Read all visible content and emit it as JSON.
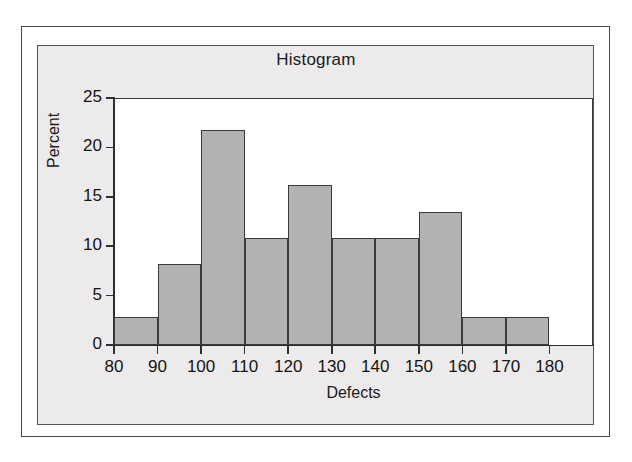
{
  "chart_data": {
    "type": "bar",
    "title": "Histogram",
    "xlabel": "Defects",
    "ylabel": "Percent",
    "xlim": [
      80,
      190
    ],
    "ylim": [
      0,
      25
    ],
    "grid": false,
    "legend": null,
    "bin_width": 10,
    "bin_edges": [
      80,
      90,
      100,
      110,
      120,
      130,
      140,
      150,
      160,
      170,
      180
    ],
    "categories": [
      "80-90",
      "90-100",
      "100-110",
      "110-120",
      "120-130",
      "130-140",
      "140-150",
      "150-160",
      "160-170",
      "170-180"
    ],
    "values": [
      2.8,
      8.2,
      21.8,
      10.8,
      16.2,
      10.8,
      10.8,
      13.5,
      2.8,
      2.8
    ],
    "x_ticks": [
      80,
      90,
      100,
      110,
      120,
      130,
      140,
      150,
      160,
      170,
      180
    ],
    "x_tick_labels": [
      "80",
      "90",
      "100",
      "110",
      "120",
      "130",
      "140",
      "150",
      "160",
      "170",
      "180"
    ],
    "y_ticks": [
      0,
      5,
      10,
      15,
      20,
      25
    ],
    "y_tick_labels": [
      "0",
      "5",
      "10",
      "15",
      "20",
      "25"
    ],
    "bar_fill_color": "#b2b2b2",
    "bar_border_color": "#3b3b3b",
    "panel_background": "#eceaea",
    "plot_background": "#ffffff"
  }
}
